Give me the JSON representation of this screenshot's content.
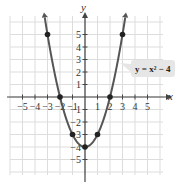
{
  "chart_data": {
    "type": "line",
    "title": "",
    "xlabel": "x",
    "ylabel": "y",
    "equation_label": "y = x² − 4",
    "function": "x^2 - 4",
    "xlim": [
      -6,
      6
    ],
    "ylim": [
      -6,
      6
    ],
    "grid": true,
    "x_ticks": [
      -5,
      -4,
      -3,
      -2,
      -1,
      1,
      2,
      3,
      4,
      5
    ],
    "y_ticks": [
      -5,
      -4,
      -3,
      -2,
      -1,
      1,
      2,
      3,
      4,
      5
    ],
    "x_tick_labels": [
      "−5",
      "−4",
      "−3",
      "−2",
      "−1",
      "1",
      "2",
      "3",
      "4",
      "5"
    ],
    "y_tick_labels": [
      "−5",
      "−4",
      "−3",
      "−2",
      "−1",
      "1",
      "2",
      "3",
      "4",
      "5"
    ],
    "points": [
      {
        "x": -3,
        "y": 5
      },
      {
        "x": -2,
        "y": 0
      },
      {
        "x": -1,
        "y": -3
      },
      {
        "x": 0,
        "y": -4
      },
      {
        "x": 1,
        "y": -3
      },
      {
        "x": 2,
        "y": 0
      },
      {
        "x": 3,
        "y": 5
      }
    ],
    "curve_color": "#555555",
    "grid_color": "#dddddd",
    "axis_color": "#444444",
    "label_box_color": "#e6e6e6"
  }
}
